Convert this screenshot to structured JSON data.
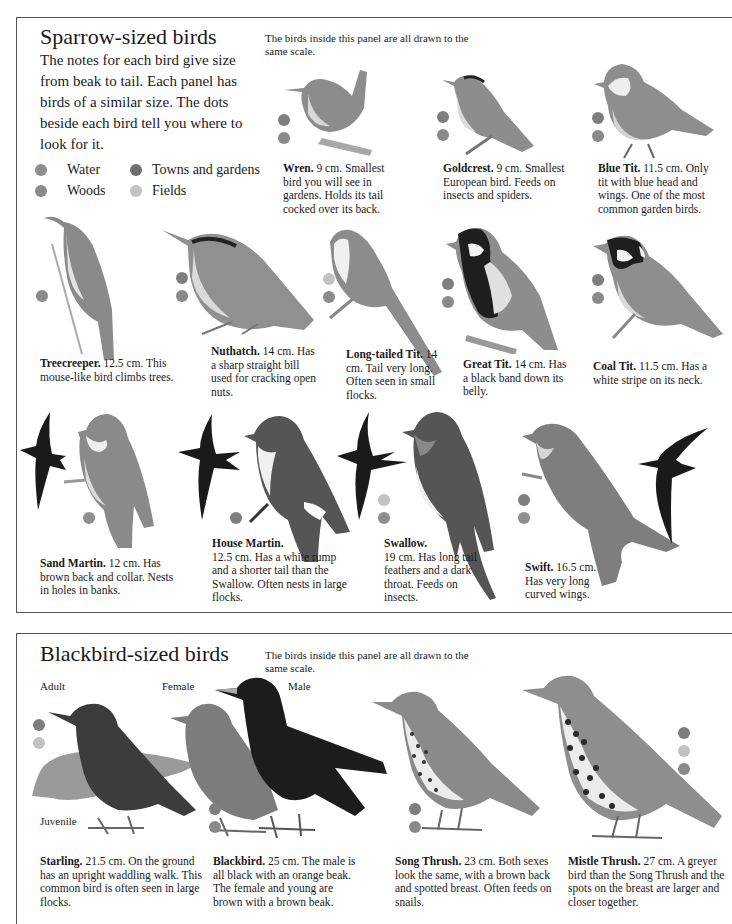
{
  "habitat_colors": {
    "water": "#8f8f8f",
    "woods": "#8a8a8a",
    "towns": "#6f6f6f",
    "fields": "#c2c2c2"
  },
  "sparrow_panel": {
    "title": "Sparrow-sized birds",
    "intro": "The notes for each bird give size from beak to tail. Each panel has birds of a similar size. The dots beside each bird tell you where to look for it.",
    "scale_note": "The birds inside this panel are all drawn to the same scale.",
    "legend": [
      {
        "label": "Water",
        "icon": "water-dot"
      },
      {
        "label": "Towns and gardens",
        "icon": "towns-dot"
      },
      {
        "label": "Woods",
        "icon": "woods-dot"
      },
      {
        "label": "Fields",
        "icon": "fields-dot"
      }
    ],
    "birds": [
      {
        "name": "Wren.",
        "desc": "9 cm. Smallest bird you will see in gardens. Holds its tail cocked over its back.",
        "habitats": [
          "towns",
          "woods"
        ]
      },
      {
        "name": "Goldcrest.",
        "desc": "9 cm. Smallest European bird. Feeds on insects and spiders.",
        "habitats": [
          "towns",
          "woods"
        ]
      },
      {
        "name": "Blue Tit.",
        "desc": "11.5 cm. Only tit with blue head and wings. One of the most common garden birds.",
        "habitats": [
          "towns",
          "woods"
        ]
      },
      {
        "name": "Treecreeper.",
        "desc": "12.5 cm. This mouse-like bird climbs trees.",
        "habitats": [
          "woods"
        ]
      },
      {
        "name": "Nuthatch.",
        "desc": "14 cm. Has a sharp straight bill used for cracking open nuts.",
        "habitats": [
          "towns",
          "woods"
        ]
      },
      {
        "name": "Long-tailed Tit.",
        "desc": "14 cm. Tail very long. Often seen in small flocks.",
        "habitats": [
          "fields",
          "woods"
        ]
      },
      {
        "name": "Great Tit.",
        "desc": "14 cm. Has a black band down its belly.",
        "habitats": [
          "towns",
          "woods"
        ]
      },
      {
        "name": "Coal Tit.",
        "desc": "11.5 cm. Has a white stripe on its neck.",
        "habitats": [
          "towns",
          "woods"
        ]
      },
      {
        "name": "Sand Martin.",
        "desc": "12 cm. Has brown back and collar. Nests in holes in banks.",
        "habitats": [
          "water"
        ]
      },
      {
        "name": "House Martin.",
        "desc": "12.5 cm. Has a white rump and a shorter tail than the Swallow. Often nests in large flocks.",
        "habitats": [
          "towns"
        ]
      },
      {
        "name": "Swallow.",
        "desc": "19 cm. Has long tail feathers and a dark throat. Feeds on insects.",
        "habitats": [
          "fields",
          "water"
        ]
      },
      {
        "name": "Swift.",
        "desc": "16.5 cm. Has very long curved wings.",
        "habitats": [
          "towns",
          "water"
        ]
      }
    ]
  },
  "blackbird_panel": {
    "title": "Blackbird-sized birds",
    "scale_note": "The birds inside this panel are all drawn to the same scale.",
    "labels": {
      "adult": "Adult",
      "juvenile": "Juvenile",
      "female": "Female",
      "male": "Male"
    },
    "birds": [
      {
        "name": "Starling.",
        "desc": "21.5 cm. On the ground has an upright waddling walk. This common bird is often seen in large flocks.",
        "habitats": [
          "towns",
          "fields"
        ]
      },
      {
        "name": "Blackbird.",
        "desc": "25 cm. The male is all black with an orange beak. The female and young are brown with a brown beak.",
        "habitats": [
          "towns",
          "woods"
        ]
      },
      {
        "name": "Song Thrush.",
        "desc": "23 cm. Both sexes look the same, with a brown back and spotted breast. Often feeds on snails.",
        "habitats": [
          "towns",
          "woods"
        ]
      },
      {
        "name": "Mistle Thrush.",
        "desc": "27 cm. A greyer bird than the Song Thrush and the spots on the breast are larger and closer together.",
        "habitats": [
          "towns",
          "fields",
          "woods"
        ]
      }
    ]
  }
}
